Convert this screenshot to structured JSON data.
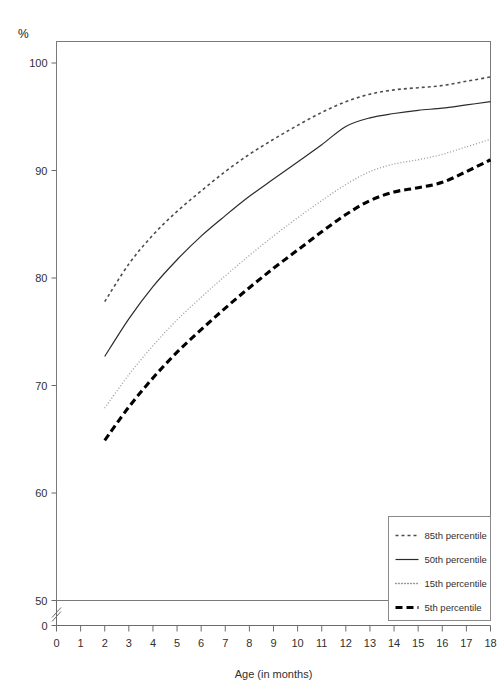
{
  "chart_data": {
    "type": "line",
    "title": "",
    "xlabel": "Age (in months)",
    "ylabel": "%",
    "xlim": [
      0,
      18
    ],
    "ylim": [
      50,
      102
    ],
    "y_axis_break": true,
    "y_break_from": 0,
    "y_break_to": 50,
    "grid": false,
    "legend_position": "bottom-right",
    "x_ticks": [
      "0",
      "1",
      "2",
      "3",
      "4",
      "5",
      "6",
      "7",
      "8",
      "9",
      "10",
      "11",
      "12",
      "13",
      "14",
      "15",
      "16",
      "17",
      "18"
    ],
    "y_ticks": [
      "0",
      "50",
      "60",
      "70",
      "80",
      "90",
      "100"
    ],
    "x": [
      2,
      3,
      4,
      5,
      6,
      7,
      8,
      9,
      10,
      11,
      12,
      13,
      14,
      15,
      16,
      17,
      18
    ],
    "series": [
      {
        "name": "85th percentile",
        "style": "dashed-coarse",
        "color": "#4d4d4d",
        "width": 1.6,
        "dash": "3,3",
        "values": [
          77.8,
          81.3,
          84.0,
          86.2,
          88.1,
          89.9,
          91.5,
          92.9,
          94.2,
          95.4,
          96.4,
          97.1,
          97.5,
          97.7,
          97.9,
          98.3,
          98.7
        ]
      },
      {
        "name": "50th percentile",
        "style": "solid",
        "color": "#2b2b2b",
        "width": 1.2,
        "dash": "",
        "values": [
          72.7,
          76.2,
          79.2,
          81.7,
          83.9,
          85.8,
          87.6,
          89.2,
          90.8,
          92.4,
          94.1,
          94.9,
          95.3,
          95.6,
          95.8,
          96.1,
          96.4
        ]
      },
      {
        "name": "15th percentile",
        "style": "dotted-fine",
        "color": "#9a9a9a",
        "width": 1.3,
        "dash": "1,2",
        "values": [
          67.9,
          71.0,
          73.7,
          76.1,
          78.2,
          80.2,
          82.1,
          83.9,
          85.6,
          87.2,
          88.7,
          89.9,
          90.6,
          91.0,
          91.5,
          92.2,
          92.9
        ]
      },
      {
        "name": "5th percentile",
        "style": "dashed-thick",
        "color": "#000000",
        "width": 3.1,
        "dash": "7,4",
        "values": [
          64.9,
          68.0,
          70.7,
          73.1,
          75.2,
          77.2,
          79.1,
          80.9,
          82.6,
          84.3,
          85.9,
          87.2,
          88.0,
          88.4,
          88.9,
          89.9,
          91.0
        ]
      }
    ]
  },
  "legend": {
    "items": [
      {
        "label": "85th percentile"
      },
      {
        "label": "50th percentile"
      },
      {
        "label": "15th percentile"
      },
      {
        "label": "5th percentile"
      }
    ]
  },
  "axes": {
    "y_unit": "%",
    "x_title": "Age (in months)"
  }
}
